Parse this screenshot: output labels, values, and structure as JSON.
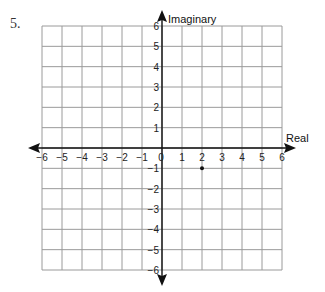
{
  "problem": {
    "number": "5."
  },
  "chart_data": {
    "type": "scatter",
    "title": "",
    "xlabel": "Real",
    "ylabel": "Imaginary",
    "xlim": [
      -6,
      6
    ],
    "ylim": [
      -6,
      6
    ],
    "grid": true,
    "x_ticks": [
      "-6",
      "-5",
      "-4",
      "-3",
      "-2",
      "-1",
      "0",
      "1",
      "2",
      "3",
      "4",
      "5",
      "6"
    ],
    "y_ticks": [
      "6",
      "5",
      "4",
      "3",
      "2",
      "1",
      "-1",
      "-2",
      "-3",
      "-4",
      "-5",
      "-6"
    ],
    "points": [
      {
        "x": 2,
        "y": -1
      }
    ],
    "legend": null
  }
}
